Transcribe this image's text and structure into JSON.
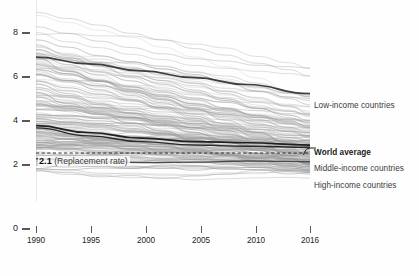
{
  "chart_data": {
    "type": "line",
    "title": "",
    "subtitle": "",
    "xlabel": "",
    "ylabel": "",
    "xlim": [
      1990,
      2016
    ],
    "ylim": [
      0,
      8.8
    ],
    "y_axis_break": true,
    "grid": false,
    "legend_position": "right-inline-annotations",
    "x_ticks": [
      1990,
      1995,
      2000,
      2005,
      2010,
      2016
    ],
    "x_tick_labels": [
      "1990",
      "1995",
      "2000",
      "2005",
      "2010",
      "2016"
    ],
    "y_ticks": [
      0,
      2,
      4,
      6,
      8
    ],
    "y_tick_labels": [
      "0",
      "2",
      "4",
      "6",
      "8"
    ],
    "reference_line": {
      "label_value": "2.1",
      "label_text": "(Replacement rate)",
      "value": 2.1,
      "style": "dashed",
      "color": "#2b2b2b"
    },
    "x": [
      1990,
      1995,
      2000,
      2005,
      2010,
      2016
    ],
    "series": [
      {
        "name": "Low-income countries",
        "values": [
          6.3,
          6.0,
          5.7,
          5.4,
          5.1,
          4.7
        ],
        "emphasis": "bold",
        "color": "#3d3d3d",
        "label_y": 105
      },
      {
        "name": "World average",
        "values": [
          3.3,
          3.0,
          2.75,
          2.6,
          2.55,
          2.45
        ],
        "emphasis": "bold",
        "color": "#1f1f1f",
        "label_y": 152
      },
      {
        "name": "Middle-income countries",
        "values": [
          3.2,
          2.85,
          2.6,
          2.45,
          2.4,
          2.35
        ],
        "emphasis": "bold",
        "color": "#2a2a2a",
        "label_y": 168
      },
      {
        "name": "High-income countries",
        "values": [
          1.85,
          1.72,
          1.68,
          1.7,
          1.75,
          1.72
        ],
        "emphasis": "bold",
        "color": "#4a4a4a",
        "label_y": 185
      }
    ],
    "background_series": {
      "description": "Individual country fertility-rate trajectories",
      "count": 190,
      "color": "#9a9a9a",
      "opacity": 0.45
    }
  },
  "axes": {
    "y_ticks": [
      {
        "label": "8",
        "y": 32
      },
      {
        "label": "6",
        "y": 76
      },
      {
        "label": "4",
        "y": 120
      },
      {
        "label": "2",
        "y": 164
      },
      {
        "label": "0",
        "y": 228
      }
    ],
    "x_ticks": [
      {
        "label": "1990",
        "x": 36
      },
      {
        "label": "1995",
        "x": 91
      },
      {
        "label": "2000",
        "x": 146
      },
      {
        "label": "2005",
        "x": 201
      },
      {
        "label": "2010",
        "x": 256
      },
      {
        "label": "2016",
        "x": 310
      }
    ]
  },
  "annotations": {
    "low_income": "Low-income countries",
    "world_average": "World average",
    "middle_income": "Middle-income countries",
    "high_income": "High-income countries",
    "replacement_value": "2.1",
    "replacement_text": "(Replacement rate)"
  },
  "colors": {
    "background": "#fefefe",
    "axis": "#58595b",
    "text": "#231f20",
    "spaghetti": "#9a9a9a",
    "highlight": "#1f1f1f"
  }
}
